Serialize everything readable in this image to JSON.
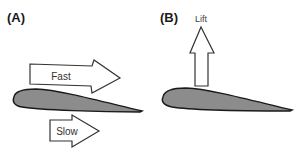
{
  "diagram": {
    "panel_a": {
      "label": "(A)",
      "arrows": [
        {
          "label": "Fast",
          "position": "above airfoil"
        },
        {
          "label": "Slow",
          "position": "below airfoil"
        }
      ],
      "airfoil": "wing cross-section"
    },
    "panel_b": {
      "label": "(B)",
      "arrows": [
        {
          "label": "Lift",
          "direction": "up"
        }
      ],
      "airfoil": "wing cross-section"
    },
    "colors": {
      "airfoil_fill": "#8c8c8c",
      "outline": "#1a1a1a",
      "arrow_fill": "#ffffff",
      "arrow_stroke": "#333333"
    }
  }
}
